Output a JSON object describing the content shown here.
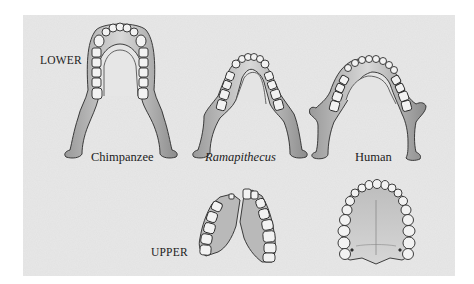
{
  "figure": {
    "row_labels": {
      "lower": "LOWER",
      "upper": "UPPER"
    },
    "species_labels": {
      "chimpanzee": "Chimpanzee",
      "ramapithecus": "Ramapithecus",
      "human": "Human"
    },
    "panels": [
      {
        "row": "lower",
        "species": "Chimpanzee",
        "shape": "U-shaped, parallel tooth rows, large canines"
      },
      {
        "row": "lower",
        "species": "Ramapithecus",
        "shape": "V-shaped, diverging tooth rows"
      },
      {
        "row": "lower",
        "species": "Human",
        "shape": "parabolic arch, small canines"
      },
      {
        "row": "upper",
        "species": "Ramapithecus",
        "shape": "two reconstructed maxilla halves"
      },
      {
        "row": "upper",
        "species": "Human",
        "shape": "parabolic palate"
      }
    ],
    "colors": {
      "page_bg": "#ffffff",
      "panel_bg": "#e8e8e8",
      "bone": "#cfcfcf",
      "bone_shadow": "#8a8a8a",
      "outline": "#2a2a2a",
      "tooth": "#f2f2f2",
      "text": "#1c1c1c"
    }
  }
}
